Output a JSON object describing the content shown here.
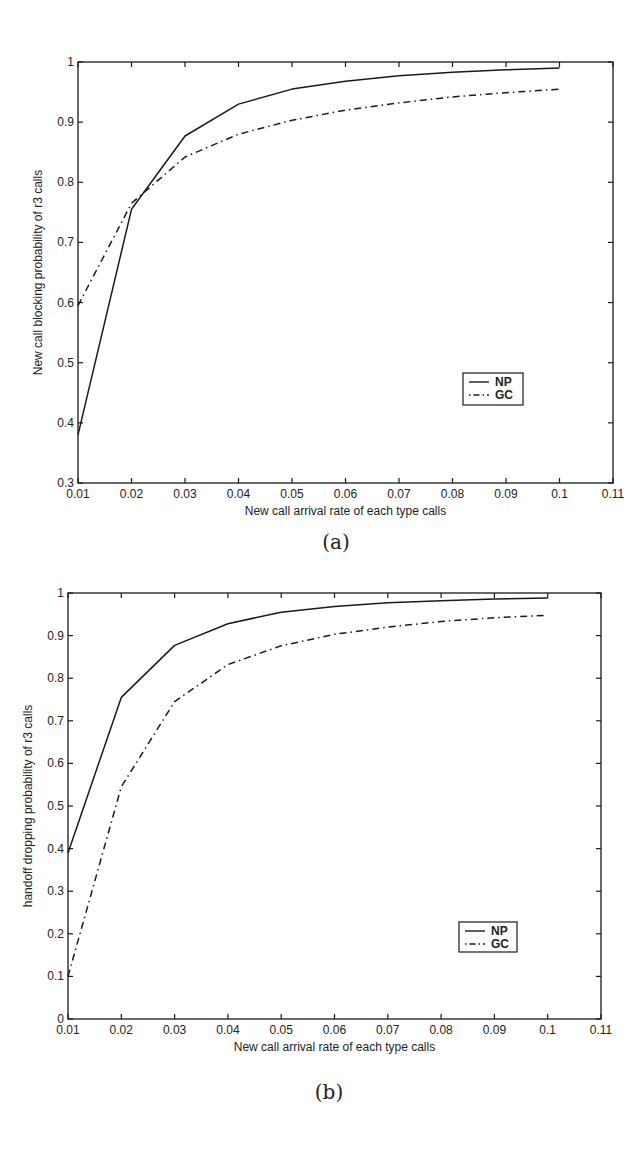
{
  "chart_data": [
    {
      "type": "line",
      "panel": "(a)",
      "title": "",
      "xlabel": "New call arrival rate of each type calls",
      "ylabel": "New call blocking probability of r3 calls",
      "xlim": [
        0.01,
        0.11
      ],
      "ylim": [
        0.3,
        1.0
      ],
      "xticks": [
        "0.01",
        "0.02",
        "0.03",
        "0.04",
        "0.05",
        "0.06",
        "0.07",
        "0.08",
        "0.09",
        "0.1",
        "0.11"
      ],
      "yticks": [
        "0.3",
        "0.4",
        "0.5",
        "0.6",
        "0.7",
        "0.8",
        "0.9",
        "1"
      ],
      "grid": false,
      "legend_position": "lower right",
      "x": [
        0.01,
        0.02,
        0.03,
        0.04,
        0.05,
        0.06,
        0.07,
        0.08,
        0.09,
        0.1
      ],
      "series": [
        {
          "name": "NP",
          "style": "solid",
          "values": [
            0.38,
            0.755,
            0.877,
            0.93,
            0.955,
            0.968,
            0.977,
            0.983,
            0.987,
            0.99
          ]
        },
        {
          "name": "GC",
          "style": "dash-dot",
          "values": [
            0.595,
            0.765,
            0.842,
            0.88,
            0.903,
            0.92,
            0.932,
            0.942,
            0.949,
            0.955
          ]
        }
      ]
    },
    {
      "type": "line",
      "panel": "(b)",
      "title": "",
      "xlabel": "New call arrival rate of each type calls",
      "ylabel": "handoff dropping probability of r3 calls",
      "xlim": [
        0.01,
        0.11
      ],
      "ylim": [
        0,
        1.0
      ],
      "xticks": [
        "0.01",
        "0.02",
        "0.03",
        "0.04",
        "0.05",
        "0.06",
        "0.07",
        "0.08",
        "0.09",
        "0.1",
        "0.11"
      ],
      "yticks": [
        "0",
        "0.1",
        "0.2",
        "0.3",
        "0.4",
        "0.5",
        "0.6",
        "0.7",
        "0.8",
        "0.9",
        "1"
      ],
      "grid": false,
      "legend_position": "lower right",
      "x": [
        0.01,
        0.02,
        0.03,
        0.04,
        0.05,
        0.06,
        0.07,
        0.08,
        0.09,
        0.1
      ],
      "series": [
        {
          "name": "NP",
          "style": "solid",
          "values": [
            0.39,
            0.755,
            0.877,
            0.928,
            0.955,
            0.968,
            0.977,
            0.982,
            0.986,
            0.988
          ]
        },
        {
          "name": "GC",
          "style": "dash-dot",
          "values": [
            0.1,
            0.545,
            0.745,
            0.832,
            0.876,
            0.903,
            0.92,
            0.933,
            0.942,
            0.948
          ]
        }
      ]
    }
  ],
  "captions": {
    "a": "(a)",
    "b": "(b)"
  },
  "colors": {
    "line": "#1a1a1a",
    "background": "#ffffff"
  }
}
